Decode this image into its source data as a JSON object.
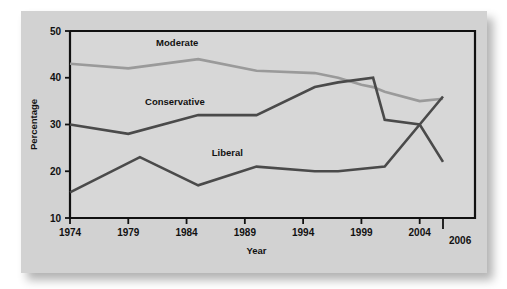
{
  "chart_data": {
    "type": "line",
    "title": "",
    "xlabel": "Year",
    "ylabel": "Percentage",
    "xlim": [
      1974,
      2006
    ],
    "ylim": [
      10,
      50
    ],
    "xticks": [
      1974,
      1979,
      1984,
      1989,
      1994,
      1999,
      2004,
      2006
    ],
    "xtick_labels": [
      "1974",
      "1979",
      "1984",
      "1989",
      "1994",
      "1999",
      "2004",
      "2006"
    ],
    "yticks": [
      10,
      20,
      30,
      40,
      50
    ],
    "ytick_labels": [
      "10",
      "20",
      "30",
      "40",
      "50"
    ],
    "grid": false,
    "legend": "inline-labels",
    "series": [
      {
        "name": "Moderate",
        "color": "#9a9a9a",
        "label_x": 1983.2,
        "label_y": 46.8,
        "x": [
          1974,
          1979,
          1985,
          1990,
          1995,
          1997,
          1999,
          2000,
          2001,
          2004,
          2006
        ],
        "values": [
          43.0,
          42.0,
          44.0,
          41.5,
          41.0,
          40.0,
          38.5,
          38.0,
          37.0,
          35.0,
          35.5
        ]
      },
      {
        "name": "Conservative",
        "color": "#4a4a4a",
        "label_x": 1983.0,
        "label_y": 34.2,
        "x": [
          1974,
          1979,
          1985,
          1990,
          1995,
          1997,
          2000,
          2001,
          2004,
          2006
        ],
        "values": [
          30.0,
          28.0,
          32.0,
          32.0,
          38.0,
          39.0,
          40.0,
          31.0,
          30.0,
          22.0
        ]
      },
      {
        "name": "Liberal",
        "color": "#4a4a4a",
        "label_x": 1987.5,
        "label_y": 23.2,
        "x": [
          1974,
          1980,
          1985,
          1990,
          1995,
          1997,
          2001,
          2006
        ],
        "values": [
          15.5,
          23.0,
          17.0,
          21.0,
          20.0,
          20.0,
          21.0,
          36.0
        ]
      }
    ],
    "colors": {
      "background": "#d2d2d2",
      "plot_background": "#d7d7d7",
      "axis": "#111111",
      "moderate": "#9a9a9a",
      "conservative": "#4a4a4a",
      "liberal": "#4a4a4a"
    }
  }
}
